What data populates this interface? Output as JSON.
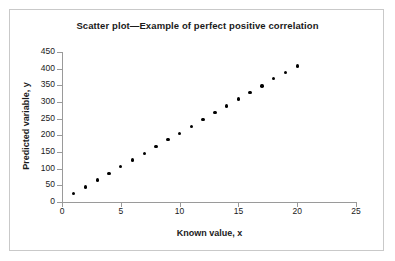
{
  "chart_data": {
    "type": "scatter",
    "title": "Scatter plot—Example of perfect positive correlation",
    "xlabel": "Known value, x",
    "ylabel": "Predicted variable, y",
    "xlim": [
      0,
      25
    ],
    "ylim": [
      0,
      450
    ],
    "xticks": [
      0,
      5,
      10,
      15,
      20,
      25
    ],
    "yticks": [
      0,
      50,
      100,
      150,
      200,
      250,
      300,
      350,
      400,
      450
    ],
    "xtick_labels": [
      "0",
      "5",
      "10",
      "15",
      "20",
      "25"
    ],
    "ytick_labels": [
      "0",
      "50",
      "100",
      "150",
      "200",
      "250",
      "300",
      "350",
      "400",
      "450"
    ],
    "grid": false,
    "legend": null,
    "marker": "filled-circle",
    "marker_color": "#000000",
    "series": [
      {
        "name": "Predicted variable, y",
        "x": [
          1,
          2,
          3,
          4,
          5,
          6,
          7,
          8,
          9,
          10,
          11,
          12,
          13,
          14,
          15,
          16,
          17,
          18,
          19,
          20
        ],
        "y": [
          25,
          45,
          66,
          85,
          106,
          126,
          146,
          166,
          187,
          206,
          227,
          248,
          268,
          288,
          309,
          329,
          348,
          370,
          389,
          408
        ]
      }
    ]
  },
  "figure": {
    "border_color": "#c9c9c9",
    "background": "#ffffff",
    "axis_color": "#9a9a9a",
    "text_color": "#1a1a1a"
  }
}
